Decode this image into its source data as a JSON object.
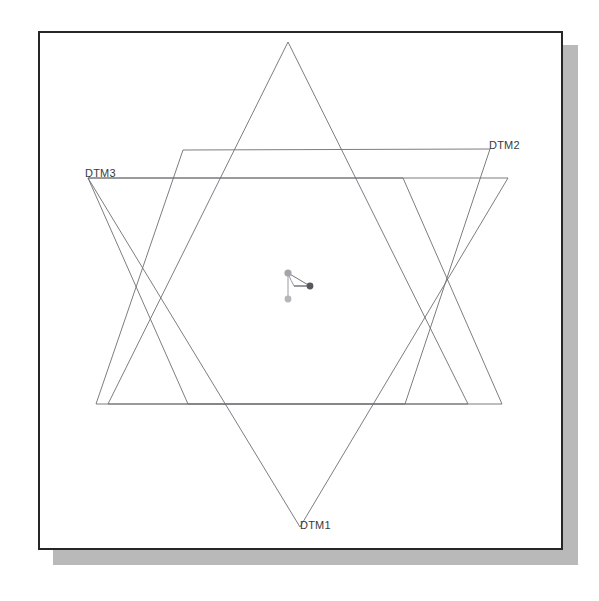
{
  "view": {
    "background_color": "#ffffff",
    "frame": {
      "x": 38,
      "y": 31,
      "width": 525,
      "height": 519,
      "border_color": "#262626",
      "fill_color": "#ffffff",
      "shadow_color": "#b9b9b9",
      "shadow_offset_x": 15,
      "shadow_offset_y": 14
    }
  },
  "geometry": {
    "line_color": "#6e6e74",
    "line_width": 0.9,
    "datum_planes": [
      {
        "name": "DTM1",
        "label": "DTM1",
        "shape": "triangle",
        "orientation": "pointing-down",
        "label_anchor_x": 300,
        "label_anchor_y": 527,
        "points": "88,178 508,178 300,527"
      },
      {
        "name": "DTM2",
        "label": "DTM2",
        "shape": "parallelogram",
        "label_anchor_x": 490,
        "label_anchor_y": 149,
        "points": "183,150 490,149 405,404 96,404"
      },
      {
        "name": "DTM3",
        "label": "DTM3",
        "shape": "parallelogram",
        "label_anchor_x": 88,
        "label_anchor_y": 178,
        "points": "88,178 403,178 502,404 188,404"
      }
    ],
    "extra_triangle": {
      "name": "datum-triangle-up",
      "points": "288,42 468,404 108,404"
    },
    "coordinate_system": {
      "name": "CSYS",
      "origin_x": 288,
      "origin_y": 273,
      "axes": [
        {
          "name": "x-axis",
          "end_x": 310,
          "end_y": 286,
          "dot_color": "#58585e",
          "dot_radius": 3.4
        },
        {
          "name": "y-axis",
          "end_x": 288,
          "end_y": 299,
          "dot_color": "#b5b5bb",
          "dot_radius": 3.4
        }
      ],
      "origin_dot_color": "#a4a4aa",
      "origin_dot_radius": 3.6
    }
  },
  "labels": {
    "dtm1": "DTM1",
    "dtm2": "DTM2",
    "dtm3": "DTM3"
  }
}
